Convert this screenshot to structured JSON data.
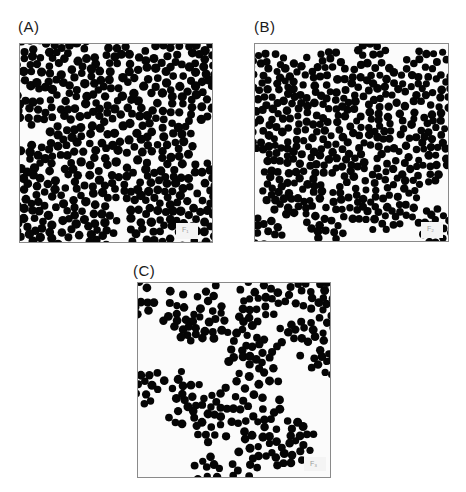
{
  "figure": {
    "panels": [
      {
        "id": "A",
        "label": "(A)",
        "label_pos": [
          18,
          18
        ],
        "box": [
          19,
          43,
          194,
          200
        ],
        "inset": {
          "box": [
            176,
            223,
            22,
            16
          ],
          "text": "F₁"
        },
        "particle_radius": 4.2,
        "density": 0.95,
        "clusters": [
          {
            "cx": 0.1,
            "cy": 0.12,
            "r": 0.3
          },
          {
            "cx": 0.52,
            "cy": 0.4,
            "r": 0.4
          },
          {
            "cx": 0.9,
            "cy": 0.14,
            "r": 0.26
          },
          {
            "cx": 0.15,
            "cy": 0.84,
            "r": 0.36
          },
          {
            "cx": 0.84,
            "cy": 0.86,
            "r": 0.3
          }
        ]
      },
      {
        "id": "B",
        "label": "(B)",
        "label_pos": [
          254,
          18
        ],
        "box": [
          254,
          43,
          195,
          199
        ],
        "inset": {
          "box": [
            421,
            222,
            22,
            16
          ],
          "text": "F₂"
        },
        "particle_radius": 3.9,
        "density": 0.9,
        "clusters": [
          {
            "cx": 0.07,
            "cy": 0.18,
            "r": 0.14
          },
          {
            "cx": 0.35,
            "cy": 0.22,
            "r": 0.2
          },
          {
            "cx": 0.6,
            "cy": 0.05,
            "r": 0.08
          },
          {
            "cx": 0.9,
            "cy": 0.17,
            "r": 0.15
          },
          {
            "cx": 0.14,
            "cy": 0.43,
            "r": 0.17
          },
          {
            "cx": 0.67,
            "cy": 0.3,
            "r": 0.19
          },
          {
            "cx": 0.42,
            "cy": 0.5,
            "r": 0.18
          },
          {
            "cx": 0.98,
            "cy": 0.38,
            "r": 0.07
          },
          {
            "cx": 0.81,
            "cy": 0.55,
            "r": 0.2
          },
          {
            "cx": 0.19,
            "cy": 0.7,
            "r": 0.17
          },
          {
            "cx": 0.55,
            "cy": 0.77,
            "r": 0.15
          },
          {
            "cx": 0.68,
            "cy": 0.8,
            "r": 0.16
          },
          {
            "cx": 0.38,
            "cy": 0.86,
            "r": 0.14
          },
          {
            "cx": 0.05,
            "cy": 0.97,
            "r": 0.1
          },
          {
            "cx": 0.93,
            "cy": 0.93,
            "r": 0.1
          }
        ]
      },
      {
        "id": "C",
        "label": "(C)",
        "label_pos": [
          133,
          262
        ],
        "box": [
          137,
          282,
          194,
          196
        ],
        "inset": {
          "box": [
            304,
            457,
            22,
            14
          ],
          "text": "F₃"
        },
        "particle_radius": 4.0,
        "density": 0.6,
        "clusters": [
          {
            "network": true,
            "count": 340
          }
        ]
      }
    ]
  }
}
